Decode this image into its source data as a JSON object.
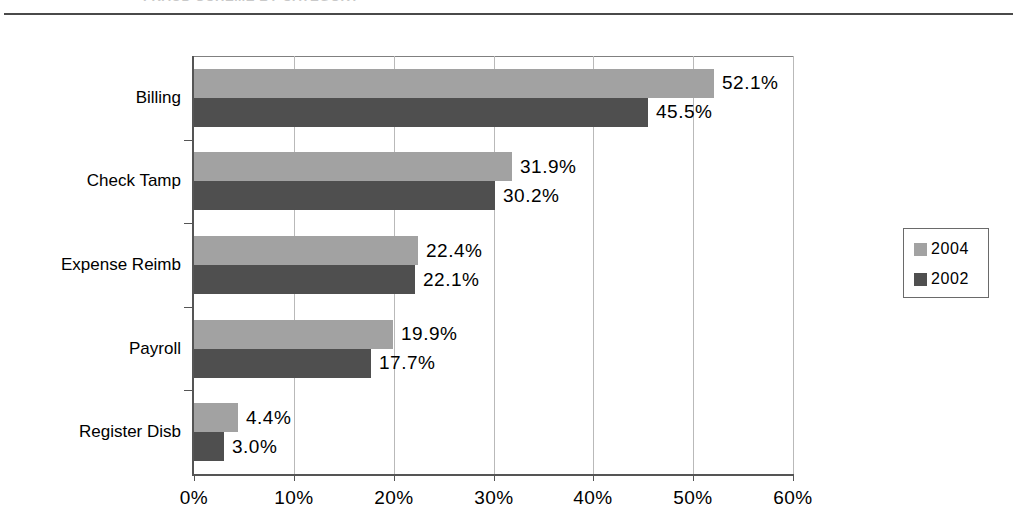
{
  "page": {
    "header_cut_text": "FRAUD SCHEME BY CATEGORY"
  },
  "legend": {
    "items": [
      {
        "label": "2004",
        "color": "#a2a2a2",
        "swatch_name": "legend-swatch-2004"
      },
      {
        "label": "2002",
        "color": "#4f4f4f",
        "swatch_name": "legend-swatch-2002"
      }
    ]
  },
  "chart_data": {
    "type": "bar",
    "orientation": "horizontal",
    "title": "",
    "xlabel": "",
    "ylabel": "",
    "categories": [
      "Billing",
      "Check Tamp",
      "Expense Reimb",
      "Payroll",
      "Register Disb"
    ],
    "series": [
      {
        "name": "2004",
        "color": "#a2a2a2",
        "values": [
          52.1,
          31.9,
          22.4,
          19.9,
          4.4
        ],
        "labels": [
          "52.1%",
          "31.9%",
          "22.4%",
          "19.9%",
          "4.4%"
        ]
      },
      {
        "name": "2002",
        "color": "#4f4f4f",
        "values": [
          45.5,
          30.2,
          22.1,
          17.7,
          3.0
        ],
        "labels": [
          "45.5%",
          "30.2%",
          "22.1%",
          "17.7%",
          "3.0%"
        ]
      }
    ],
    "xlim": [
      0,
      60
    ],
    "xticks": [
      0,
      10,
      20,
      30,
      40,
      50,
      60
    ],
    "xtick_labels": [
      "0%",
      "10%",
      "20%",
      "30%",
      "40%",
      "50%",
      "60%"
    ],
    "grid": true,
    "grid_axis": "x",
    "legend_position": "right",
    "value_labels": true
  }
}
